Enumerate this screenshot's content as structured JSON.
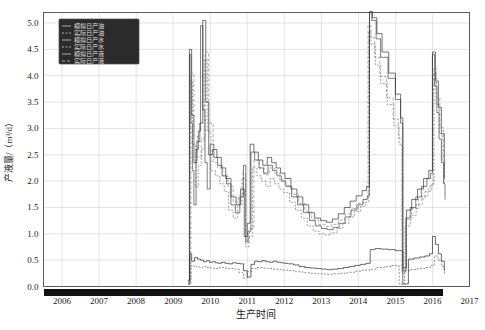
{
  "chart_data": {
    "type": "line",
    "title": "",
    "xlabel": "生产时间",
    "ylabel": "产液量/（m³/d）",
    "xlim": [
      2005.5,
      2017.0
    ],
    "ylim": [
      0.0,
      5.2
    ],
    "grid": true,
    "legend_position": "top-left",
    "xticks": [
      "2006",
      "2007",
      "2008",
      "2009",
      "2010",
      "2011",
      "2012",
      "2013",
      "2014",
      "2015",
      "2016",
      "2017"
    ],
    "yticks": [
      "0.0",
      "0.5",
      "1.0",
      "1.5",
      "2.0",
      "2.5",
      "3.0",
      "3.5",
      "4.0",
      "4.5",
      "5.0"
    ],
    "colors": {
      "sim_oil": "#1a1a1a",
      "act_oil": "#555555",
      "sim_water": "#3b3b3b",
      "act_water": "#6e6e6e",
      "sim_liquid": "#2a2a2a",
      "act_liquid": "#7d7d7d",
      "legend_bg": "#2b2b2b",
      "legend_text": "#d9d9d9",
      "grid": "#c9c9c9",
      "frame": "#4d4d4d",
      "axis_band": "#111111"
    },
    "series": [
      {
        "name": "模拟日产油",
        "key": "sim_oil",
        "color": "#1a1a1a",
        "dash": "none",
        "x": [
          2009.4,
          2009.45,
          2009.5,
          2009.58,
          2009.66,
          2009.74,
          2009.82,
          2009.9,
          2009.98,
          2010.06,
          2010.14,
          2010.22,
          2010.3,
          2010.4,
          2010.5,
          2010.6,
          2010.7,
          2010.8,
          2010.9,
          2011.0,
          2011.1,
          2011.2,
          2011.3,
          2011.4,
          2011.5,
          2011.6,
          2011.7,
          2011.8,
          2011.9,
          2012.0,
          2012.1,
          2012.25,
          2012.4,
          2012.55,
          2012.7,
          2012.85,
          2013.0,
          2013.15,
          2013.3,
          2013.45,
          2013.6,
          2013.75,
          2013.9,
          2014.05,
          2014.2,
          2014.32,
          2014.45,
          2014.6,
          2014.8,
          2015.0,
          2015.2,
          2015.35,
          2015.5,
          2015.65,
          2015.8,
          2015.92,
          2016.0,
          2016.08,
          2016.16,
          2016.24,
          2016.32
        ],
        "y": [
          0.05,
          0.62,
          0.48,
          0.55,
          0.52,
          0.5,
          0.47,
          0.49,
          0.46,
          0.47,
          0.45,
          0.44,
          0.46,
          0.44,
          0.43,
          0.45,
          0.44,
          0.43,
          0.3,
          0.18,
          0.42,
          0.48,
          0.47,
          0.49,
          0.47,
          0.46,
          0.48,
          0.46,
          0.45,
          0.44,
          0.43,
          0.41,
          0.38,
          0.36,
          0.35,
          0.34,
          0.33,
          0.32,
          0.33,
          0.34,
          0.36,
          0.38,
          0.4,
          0.42,
          0.44,
          0.7,
          0.72,
          0.71,
          0.7,
          0.68,
          0.05,
          0.52,
          0.54,
          0.56,
          0.58,
          0.62,
          0.95,
          0.8,
          0.62,
          0.48,
          0.3
        ]
      },
      {
        "name": "实际日产油",
        "key": "act_oil",
        "color": "#555555",
        "dash": "2,1.5",
        "x": [
          2009.4,
          2009.48,
          2009.56,
          2009.64,
          2009.72,
          2009.8,
          2009.9,
          2010.0,
          2010.12,
          2010.24,
          2010.36,
          2010.5,
          2010.64,
          2010.78,
          2010.9,
          2011.0,
          2011.12,
          2011.26,
          2011.4,
          2011.54,
          2011.68,
          2011.82,
          2011.96,
          2012.1,
          2012.3,
          2012.5,
          2012.7,
          2012.9,
          2013.1,
          2013.3,
          2013.5,
          2013.7,
          2013.9,
          2014.1,
          2014.3,
          2014.5,
          2014.7,
          2014.9,
          2015.1,
          2015.25,
          2015.4,
          2015.6,
          2015.8,
          2015.95,
          2016.05,
          2016.15,
          2016.25,
          2016.32
        ],
        "y": [
          0.04,
          0.4,
          0.38,
          0.37,
          0.36,
          0.38,
          0.36,
          0.35,
          0.34,
          0.36,
          0.35,
          0.34,
          0.33,
          0.26,
          0.16,
          0.28,
          0.34,
          0.36,
          0.35,
          0.34,
          0.33,
          0.32,
          0.31,
          0.3,
          0.28,
          0.26,
          0.25,
          0.24,
          0.23,
          0.24,
          0.25,
          0.27,
          0.29,
          0.31,
          0.33,
          0.36,
          0.38,
          0.4,
          0.04,
          0.3,
          0.32,
          0.34,
          0.36,
          0.4,
          0.58,
          0.5,
          0.38,
          0.24
        ]
      },
      {
        "name": "模拟日产水",
        "key": "sim_water",
        "color": "#3b3b3b",
        "dash": "none",
        "x": [
          2009.4,
          2009.44,
          2009.48,
          2009.52,
          2009.56,
          2009.62,
          2009.68,
          2009.74,
          2009.8,
          2009.86,
          2009.92,
          2010.0,
          2010.1,
          2010.2,
          2010.32,
          2010.44,
          2010.56,
          2010.68,
          2010.8,
          2010.9,
          2010.96,
          2011.02,
          2011.1,
          2011.2,
          2011.32,
          2011.44,
          2011.56,
          2011.68,
          2011.8,
          2011.92,
          2012.04,
          2012.2,
          2012.36,
          2012.52,
          2012.68,
          2012.84,
          2013.0,
          2013.16,
          2013.32,
          2013.48,
          2013.64,
          2013.8,
          2013.96,
          2014.12,
          2014.24,
          2014.3,
          2014.36,
          2014.48,
          2014.6,
          2014.8,
          2015.0,
          2015.14,
          2015.2,
          2015.28,
          2015.4,
          2015.55,
          2015.7,
          2015.85,
          2015.95,
          2016.0,
          2016.06,
          2016.12,
          2016.18,
          2016.24,
          2016.3,
          2016.34
        ],
        "y": [
          0.1,
          4.4,
          3.1,
          2.2,
          1.55,
          2.6,
          2.95,
          4.95,
          3.35,
          2.35,
          1.85,
          2.7,
          2.45,
          2.3,
          2.1,
          1.95,
          1.55,
          1.4,
          1.7,
          2.3,
          0.85,
          1.05,
          2.55,
          2.4,
          2.25,
          2.15,
          2.3,
          2.2,
          2.1,
          2.0,
          1.9,
          1.7,
          1.55,
          1.4,
          1.25,
          1.15,
          1.1,
          1.08,
          1.12,
          1.2,
          1.32,
          1.45,
          1.55,
          1.65,
          1.72,
          5.2,
          5.05,
          4.7,
          4.35,
          3.95,
          3.55,
          3.1,
          0.3,
          1.3,
          1.5,
          1.7,
          1.9,
          2.05,
          2.15,
          4.4,
          3.8,
          3.3,
          2.8,
          2.35,
          1.95,
          1.65
        ]
      },
      {
        "name": "实际日产水",
        "key": "act_water",
        "color": "#6e6e6e",
        "dash": "2,1.5",
        "x": [
          2009.4,
          2009.46,
          2009.52,
          2009.6,
          2009.68,
          2009.76,
          2009.84,
          2009.92,
          2010.02,
          2010.14,
          2010.26,
          2010.38,
          2010.5,
          2010.62,
          2010.74,
          2010.86,
          2010.96,
          2011.04,
          2011.14,
          2011.26,
          2011.38,
          2011.5,
          2011.62,
          2011.74,
          2011.86,
          2011.98,
          2012.14,
          2012.3,
          2012.46,
          2012.62,
          2012.78,
          2012.94,
          2013.1,
          2013.26,
          2013.42,
          2013.58,
          2013.74,
          2013.9,
          2014.06,
          2014.2,
          2014.28,
          2014.34,
          2014.46,
          2014.6,
          2014.78,
          2014.96,
          2015.1,
          2015.18,
          2015.26,
          2015.4,
          2015.56,
          2015.72,
          2015.88,
          2015.98,
          2016.04,
          2016.1,
          2016.18,
          2016.26,
          2016.32
        ],
        "y": [
          0.08,
          3.9,
          2.7,
          1.9,
          2.3,
          2.6,
          4.3,
          2.95,
          2.2,
          2.1,
          1.95,
          1.8,
          1.45,
          1.3,
          1.55,
          2.05,
          0.75,
          0.95,
          2.25,
          2.1,
          2.0,
          1.9,
          2.05,
          1.95,
          1.85,
          1.78,
          1.6,
          1.45,
          1.3,
          1.15,
          1.05,
          1.0,
          0.98,
          1.02,
          1.1,
          1.2,
          1.32,
          1.42,
          1.52,
          1.6,
          4.85,
          4.6,
          4.2,
          3.85,
          3.45,
          3.05,
          2.7,
          0.25,
          1.15,
          1.35,
          1.55,
          1.72,
          1.85,
          1.95,
          4.05,
          3.45,
          2.9,
          2.4,
          1.95
        ]
      },
      {
        "name": "模拟日产液",
        "key": "sim_liquid",
        "color": "#2a2a2a",
        "dash": "none",
        "x": [
          2009.4,
          2009.44,
          2009.5,
          2009.56,
          2009.64,
          2009.72,
          2009.8,
          2009.88,
          2009.96,
          2010.06,
          2010.18,
          2010.3,
          2010.42,
          2010.56,
          2010.7,
          2010.82,
          2010.92,
          2011.0,
          2011.08,
          2011.18,
          2011.3,
          2011.42,
          2011.54,
          2011.66,
          2011.78,
          2011.9,
          2012.02,
          2012.18,
          2012.34,
          2012.5,
          2012.66,
          2012.82,
          2012.98,
          2013.14,
          2013.3,
          2013.46,
          2013.62,
          2013.78,
          2013.94,
          2014.1,
          2014.22,
          2014.3,
          2014.38,
          2014.5,
          2014.64,
          2014.82,
          2015.0,
          2015.14,
          2015.2,
          2015.3,
          2015.44,
          2015.6,
          2015.76,
          2015.9,
          2016.0,
          2016.08,
          2016.16,
          2016.24,
          2016.32
        ],
        "y": [
          0.12,
          4.5,
          3.25,
          2.35,
          2.75,
          3.1,
          5.05,
          3.5,
          2.5,
          2.6,
          2.45,
          2.25,
          2.05,
          1.7,
          1.55,
          1.85,
          0.95,
          1.2,
          2.7,
          2.55,
          2.4,
          2.3,
          2.45,
          2.35,
          2.25,
          2.15,
          2.05,
          1.85,
          1.7,
          1.55,
          1.4,
          1.3,
          1.25,
          1.22,
          1.28,
          1.38,
          1.5,
          1.62,
          1.72,
          1.82,
          1.9,
          5.22,
          5.1,
          4.8,
          4.45,
          4.05,
          3.65,
          3.2,
          0.35,
          1.45,
          1.65,
          1.85,
          2.05,
          2.2,
          4.45,
          3.9,
          3.4,
          2.9,
          2.05
        ]
      },
      {
        "name": "实际日产液",
        "key": "act_liquid",
        "color": "#7d7d7d",
        "dash": "3,2",
        "x": [
          2009.4,
          2009.48,
          2009.56,
          2009.66,
          2009.76,
          2009.86,
          2009.96,
          2010.08,
          2010.2,
          2010.34,
          2010.48,
          2010.62,
          2010.76,
          2010.88,
          2010.96,
          2011.06,
          2011.18,
          2011.32,
          2011.46,
          2011.6,
          2011.74,
          2011.88,
          2012.02,
          2012.2,
          2012.38,
          2012.56,
          2012.74,
          2012.92,
          2013.1,
          2013.28,
          2013.46,
          2013.64,
          2013.82,
          2014.0,
          2014.16,
          2014.26,
          2014.34,
          2014.44,
          2014.58,
          2014.76,
          2014.94,
          2015.08,
          2015.18,
          2015.28,
          2015.44,
          2015.62,
          2015.8,
          2015.94,
          2016.02,
          2016.1,
          2016.2,
          2016.3
        ],
        "y": [
          0.1,
          4.05,
          2.85,
          2.45,
          2.8,
          4.45,
          3.1,
          2.35,
          2.25,
          2.1,
          1.9,
          1.6,
          1.72,
          2.15,
          0.85,
          1.1,
          2.4,
          2.25,
          2.12,
          2.25,
          2.15,
          2.02,
          1.92,
          1.75,
          1.58,
          1.42,
          1.28,
          1.18,
          1.14,
          1.18,
          1.26,
          1.38,
          1.48,
          1.58,
          1.66,
          4.95,
          4.72,
          4.35,
          3.98,
          3.58,
          3.18,
          2.82,
          0.28,
          1.28,
          1.48,
          1.66,
          1.8,
          1.92,
          4.15,
          3.58,
          3.02,
          2.45
        ]
      }
    ]
  }
}
